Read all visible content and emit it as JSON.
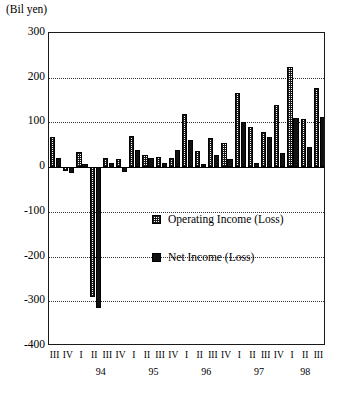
{
  "chart_data": {
    "type": "bar",
    "title": "",
    "units_label": "(Bil yen)",
    "ylabel": "",
    "xlabel": "",
    "ylim": [
      -400,
      300
    ],
    "yticks": [
      300,
      200,
      100,
      0,
      -100,
      -200,
      -300,
      -400
    ],
    "ytick_labels": [
      "300",
      "200",
      "100",
      "0",
      "-100",
      "-200",
      "-300",
      "-400"
    ],
    "grid": true,
    "grid_axis": "y",
    "legend_position": "center",
    "categories": [
      "III",
      "IV",
      "I",
      "II",
      "III",
      "IV",
      "I",
      "II",
      "III",
      "IV",
      "I",
      "II",
      "III",
      "IV",
      "I",
      "II",
      "III",
      "IV",
      "I",
      "II",
      "III"
    ],
    "year_groups": [
      {
        "label": "94",
        "start_index": 2,
        "end_index": 5
      },
      {
        "label": "95",
        "start_index": 6,
        "end_index": 9
      },
      {
        "label": "96",
        "start_index": 10,
        "end_index": 13
      },
      {
        "label": "97",
        "start_index": 14,
        "end_index": 17
      },
      {
        "label": "98",
        "start_index": 18,
        "end_index": 20
      }
    ],
    "series": [
      {
        "name": "Operating Income (Loss)",
        "key": "op",
        "color": "#1a1a1a",
        "fill": "checkered",
        "values": [
          68,
          -8,
          33,
          -290,
          20,
          18,
          70,
          27,
          22,
          20,
          118,
          36,
          66,
          53,
          165,
          90,
          78,
          140,
          225,
          108,
          178
        ]
      },
      {
        "name": "Net Income (Loss)",
        "key": "net",
        "color": "#111111",
        "fill": "solid",
        "values": [
          20,
          -13,
          6,
          -315,
          10,
          -10,
          38,
          20,
          10,
          38,
          60,
          8,
          28,
          18,
          100,
          10,
          68,
          32,
          110,
          45,
          113
        ]
      }
    ]
  }
}
